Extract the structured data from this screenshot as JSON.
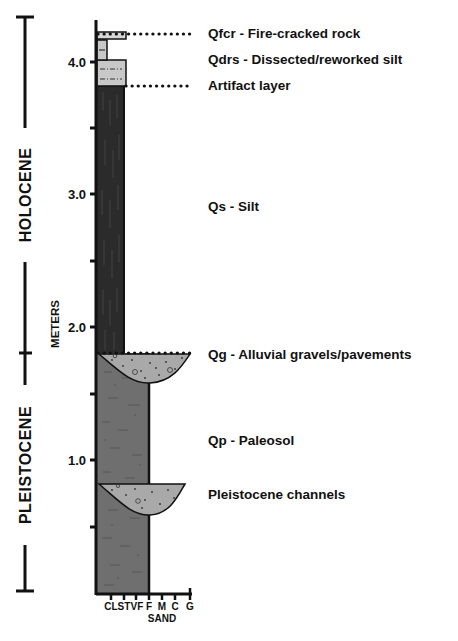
{
  "figure": {
    "epochs": [
      {
        "name": "HOLOCENE",
        "top_m": 4.3,
        "bottom_m": 1.8
      },
      {
        "name": "PLEISTOCENE",
        "top_m": 1.8,
        "bottom_m": 0.0
      }
    ],
    "y_axis": {
      "label": "METERS",
      "major_ticks": [
        "4.0",
        "3.0",
        "2.0",
        "1.0"
      ],
      "minor_ticks_m": [
        3.5,
        2.5,
        1.5,
        0.5
      ]
    },
    "x_axis": {
      "grain_sizes": [
        "CL",
        "ST",
        "VF",
        "F",
        "M",
        "C",
        "G"
      ],
      "group_label": "SAND"
    },
    "units": [
      {
        "code": "Qfcr",
        "label": "Qfcr - Fire-cracked rock",
        "depth_m": 4.2
      },
      {
        "code": "Qdrs",
        "label": "Qdrs - Dissected/reworked silt",
        "depth_m": 4.0
      },
      {
        "code": "Artifact",
        "label": "Artifact layer",
        "depth_m": 3.8
      },
      {
        "code": "Qs",
        "label": "Qs - Silt",
        "depth_m": 3.0
      },
      {
        "code": "Qg",
        "label": "Qg - Alluvial gravels/pavements",
        "depth_m": 1.8
      },
      {
        "code": "Qp",
        "label": "Qp - Paleosol",
        "depth_m": 1.0
      },
      {
        "code": "Channels",
        "label": "Pleistocene channels",
        "depth_m": 0.8
      }
    ],
    "colors": {
      "silt": "#2b2b2b",
      "paleosol": "#6f6f6f",
      "gravel": "#a9a9a9",
      "reworked_silt": "#c8c8c8",
      "line": "#111111"
    }
  }
}
